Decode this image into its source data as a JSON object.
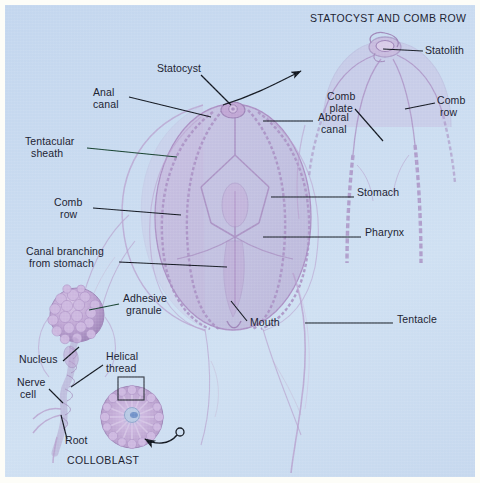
{
  "figure": {
    "background_color": "#c8daf0",
    "border_color": "#fdfdf8",
    "organism": "ctenophore",
    "ink_color": "#1d2433",
    "body_color": "#b49ac8",
    "title": "STATOCYST AND COMB ROW",
    "inset_title": "STATOCYST AND COMB ROW",
    "bottom_caption": "COLLOBLAST"
  },
  "labels": {
    "statocyst": "Statocyst",
    "anal_canal": "Anal\ncanal",
    "tentacular_sheath": "Tentacular\n  sheath",
    "comb_row_main": "Comb\n  row",
    "canal_branching": "Canal branching\n from stomach",
    "adhesive_granule": "Adhesive\n granule",
    "nucleus": "Nucleus",
    "helical_thread": "Helical\nthread",
    "nerve_cell": "Nerve\n cell",
    "root": "Root",
    "colloblast": "COLLOBLAST",
    "statolith": "Statolith",
    "comb_plate": "Comb\nplate",
    "comb_row_inset": "Comb\n row",
    "aboral_canal": "Aboral\n canal",
    "stomach": "Stomach",
    "pharynx": "Pharynx",
    "tentacle": "Tentacle",
    "mouth": "Mouth"
  },
  "label_positions": [
    {
      "name": "inset-title",
      "text": "STATOCYST AND COMB ROW",
      "x": 305,
      "y": 14,
      "align": "left"
    },
    {
      "name": "statolith",
      "text": "Statolith",
      "x": 420,
      "y": 46,
      "align": "left"
    },
    {
      "name": "statocyst",
      "text": "Statocyst",
      "x": 152,
      "y": 64,
      "align": "left"
    },
    {
      "name": "anal-canal",
      "text": "Anal canal",
      "x": 88,
      "y": 88,
      "align": "left"
    },
    {
      "name": "comb-plate",
      "text": "Comb plate",
      "x": 322,
      "y": 92,
      "align": "left"
    },
    {
      "name": "comb-row-inset",
      "text": "Comb row",
      "x": 432,
      "y": 96,
      "align": "left"
    },
    {
      "name": "aboral-canal",
      "text": "Aboral canal",
      "x": 313,
      "y": 113,
      "align": "left"
    },
    {
      "name": "tentacular-sheath",
      "text": "Tentacular sheath",
      "x": 20,
      "y": 137,
      "align": "left"
    },
    {
      "name": "stomach",
      "text": "Stomach",
      "x": 352,
      "y": 188,
      "align": "left"
    },
    {
      "name": "comb-row-main",
      "text": "Comb row",
      "x": 49,
      "y": 198,
      "align": "left"
    },
    {
      "name": "pharynx",
      "text": "Pharynx",
      "x": 360,
      "y": 228,
      "align": "left"
    },
    {
      "name": "canal-branching",
      "text": "Canal branching from stomach",
      "x": 21,
      "y": 247,
      "align": "left"
    },
    {
      "name": "adhesive-granule",
      "text": "Adhesive granule",
      "x": 118,
      "y": 294,
      "align": "left"
    },
    {
      "name": "mouth",
      "text": "Mouth",
      "x": 245,
      "y": 318,
      "align": "left"
    },
    {
      "name": "tentacle",
      "text": "Tentacle",
      "x": 392,
      "y": 315,
      "align": "left"
    },
    {
      "name": "nucleus",
      "text": "Nucleus",
      "x": 14,
      "y": 355,
      "align": "left"
    },
    {
      "name": "helical-thread",
      "text": "Helical thread",
      "x": 101,
      "y": 352,
      "align": "left"
    },
    {
      "name": "nerve-cell",
      "text": "Nerve cell",
      "x": 12,
      "y": 378,
      "align": "left"
    },
    {
      "name": "root",
      "text": "Root",
      "x": 60,
      "y": 436,
      "align": "left"
    },
    {
      "name": "colloblast-caption",
      "text": "COLLOBLAST",
      "x": 62,
      "y": 456,
      "align": "left"
    }
  ]
}
